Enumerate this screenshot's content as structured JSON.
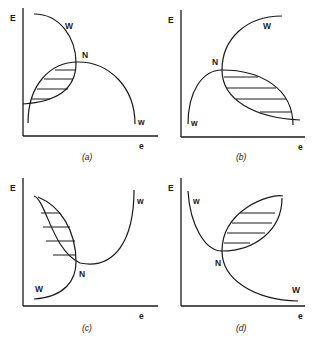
{
  "figure": {
    "panels": [
      {
        "id": "a",
        "caption": "(a)",
        "y_axis_label": "E",
        "x_axis_label": "e",
        "curve_labels": {
          "upper": "W",
          "lower": "w",
          "intersection": "N"
        },
        "description": "W curve descends from upper-left bending down toward lower-left; w curve is an arch opening downward; shaded lens region left of N"
      },
      {
        "id": "b",
        "caption": "(b)",
        "y_axis_label": "E",
        "x_axis_label": "e",
        "curve_labels": {
          "upper": "W",
          "lower": "w",
          "intersection": "N"
        },
        "description": "W curve rises from lower-right through N to upper-right; w curve is an arch from lower-left peaking near N descending to lower-right; shaded lens right of N"
      },
      {
        "id": "c",
        "caption": "(c)",
        "y_axis_label": "E",
        "x_axis_label": "e",
        "curve_labels": {
          "upper": "w",
          "lower": "W",
          "intersection": "N"
        },
        "description": "w curve is a U shape from upper-left through N rising to upper-right; W curve rises from lower-left through N to upper-left; shaded lens above-left of N"
      },
      {
        "id": "d",
        "caption": "(d)",
        "y_axis_label": "E",
        "x_axis_label": "e",
        "curve_labels": {
          "upper": "w",
          "lower": "W",
          "intersection": "N"
        },
        "description": "w curve is a U from upper-left through N rising to upper-right; W curve descends from upper-right through N to lower-right; shaded lens above-right of N"
      }
    ]
  }
}
